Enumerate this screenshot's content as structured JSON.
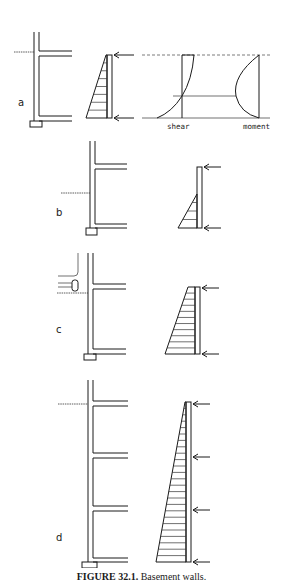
{
  "caption": {
    "figure_number": "FIGURE 32.1.",
    "title": "Basement walls."
  },
  "colors": {
    "ink": "#1a1a1a",
    "background": "#ffffff"
  },
  "panels": [
    {
      "id": "a",
      "label": "a",
      "label_pos": [
        18,
        106
      ],
      "wall": {
        "x": 34,
        "top": 32,
        "bottom": 121,
        "thickness": 5
      },
      "slabs": [
        {
          "y": 51,
          "h": 5
        },
        {
          "y": 116,
          "h": 5
        }
      ],
      "slab_right": 72,
      "footing": {
        "x": 30,
        "y": 121,
        "w": 12,
        "h": 6
      },
      "grade": {
        "y": 52,
        "x1": 14
      },
      "load": {
        "type": "triangle",
        "strip_x": 107,
        "strip_w": 5,
        "top": 55,
        "bottom": 118,
        "top_width": 1,
        "base_width": 21,
        "hatches": 7,
        "arrows": [
          55,
          118
        ],
        "arrow_x1": 134,
        "arrow_x2": 114
      },
      "extras": {
        "shear_label": "shear",
        "moment_label": "moment",
        "top_y": 55,
        "bottom_y": 118,
        "mid_y": 96
      }
    },
    {
      "id": "b",
      "label": "b",
      "label_pos": [
        56,
        216
      ],
      "wall": {
        "x": 90,
        "top": 141,
        "bottom": 228,
        "thickness": 5
      },
      "slabs": [
        {
          "y": 164,
          "h": 5
        },
        {
          "y": 224,
          "h": 4
        }
      ],
      "slab_right": 127,
      "footing": {
        "x": 86,
        "y": 228,
        "w": 11,
        "h": 7
      },
      "grade": {
        "y": 193,
        "x1": 61
      },
      "load": {
        "type": "partial-triangle",
        "strip_x": 197,
        "strip_w": 5,
        "top": 167,
        "bottom": 228,
        "tri_top": 194,
        "base_width": 19,
        "hatches": 3,
        "arrows": [
          167,
          228
        ],
        "arrow_x1": 221,
        "arrow_x2": 204
      }
    },
    {
      "id": "c",
      "label": "c",
      "label_pos": [
        56,
        333
      ],
      "wall": {
        "x": 88,
        "top": 253,
        "bottom": 354,
        "thickness": 5
      },
      "slabs": [
        {
          "y": 284,
          "h": 5
        },
        {
          "y": 349,
          "h": 5
        }
      ],
      "slab_right": 126,
      "footing": {
        "x": 84,
        "y": 354,
        "w": 12,
        "h": 6
      },
      "grade": {
        "y": 293,
        "x1": 57
      },
      "surcharge": true,
      "load": {
        "type": "trapezoid",
        "strip_x": 195,
        "strip_w": 5,
        "top": 287,
        "bottom": 354,
        "top_width": 7,
        "base_width": 30,
        "hatches": 10,
        "arrows": [
          288,
          354
        ],
        "arrow_x1": 219,
        "arrow_x2": 202
      }
    },
    {
      "id": "d",
      "label": "d",
      "label_pos": [
        56,
        541
      ],
      "wall": {
        "x": 88,
        "top": 380,
        "bottom": 562,
        "thickness": 5
      },
      "slabs": [
        {
          "y": 401,
          "h": 5
        },
        {
          "y": 453,
          "h": 5
        },
        {
          "y": 506,
          "h": 5
        },
        {
          "y": 558,
          "h": 4
        }
      ],
      "slab_right": 128,
      "footing": {
        "x": 82,
        "y": 562,
        "w": 15,
        "h": 6
      },
      "grade": {
        "y": 404,
        "x1": 58
      },
      "load": {
        "type": "triangle",
        "strip_x": 186,
        "strip_w": 5,
        "top": 402,
        "bottom": 562,
        "top_width": 1,
        "base_width": 30,
        "hatches": 24,
        "arrows": [
          404,
          457,
          510,
          562
        ],
        "arrow_x1": 210,
        "arrow_x2": 193
      }
    }
  ]
}
